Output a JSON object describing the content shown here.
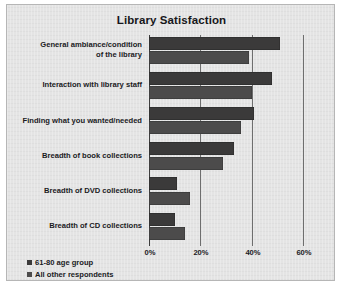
{
  "chart_data": {
    "type": "bar",
    "orientation": "horizontal",
    "title": "Library Satisfaction",
    "xlabel": "",
    "ylabel": "",
    "xlim": [
      0,
      60
    ],
    "xticks": [
      "0%",
      "20%",
      "40%",
      "60%"
    ],
    "xtick_values": [
      0,
      20,
      40,
      60
    ],
    "grid": true,
    "legend_position": "bottom-left",
    "categories": [
      "General ambiance/condition of the library",
      "Interaction with library staff",
      "Finding what you wanted/needed",
      "Breadth of book collections",
      "Breadth of DVD collections",
      "Breadth of CD collections"
    ],
    "category_lines": [
      [
        "General ambiance/condition",
        "of the library"
      ],
      [
        "Interaction with library staff"
      ],
      [
        "Finding what you wanted/needed"
      ],
      [
        "Breadth of book collections"
      ],
      [
        "Breadth of DVD collections"
      ],
      [
        "Breadth of CD collections"
      ]
    ],
    "series": [
      {
        "name": "61-80 age group",
        "color": "#3b3a3a",
        "values": [
          51,
          48,
          41,
          33,
          11,
          10
        ]
      },
      {
        "name": "All other respondents",
        "color": "#4c4b4b",
        "values": [
          39,
          40,
          36,
          29,
          16,
          14
        ]
      }
    ]
  },
  "legend": {
    "items": [
      {
        "label": "61-80 age group",
        "color": "#3b3a3a"
      },
      {
        "label": "All other respondents",
        "color": "#4c4b4b"
      }
    ]
  },
  "caption": ""
}
